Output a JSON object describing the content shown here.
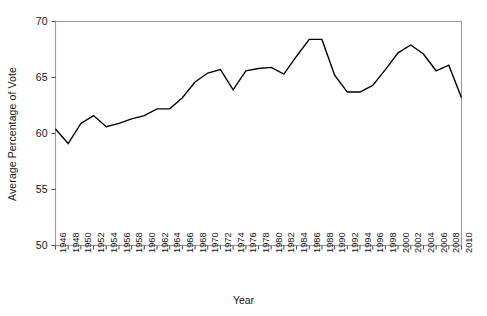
{
  "chart_data": {
    "type": "line",
    "title": "",
    "xlabel": "Year",
    "ylabel": "Average Percentage of Vote",
    "xlim": [
      1946,
      2010
    ],
    "ylim": [
      50,
      70
    ],
    "yticks": [
      50,
      55,
      60,
      65,
      70
    ],
    "grid": false,
    "legend": null,
    "line_color": "#000000",
    "frame_color": "#9a9a9a",
    "x": [
      1946,
      1948,
      1950,
      1952,
      1954,
      1956,
      1958,
      1960,
      1962,
      1964,
      1966,
      1968,
      1970,
      1972,
      1974,
      1976,
      1978,
      1980,
      1982,
      1984,
      1986,
      1988,
      1990,
      1992,
      1994,
      1996,
      1998,
      2000,
      2002,
      2004,
      2006,
      2008,
      2010
    ],
    "xticks": [
      "1946",
      "1948",
      "1950",
      "1952",
      "1954",
      "1956",
      "1958",
      "1960",
      "1962",
      "1964",
      "1966",
      "1968",
      "1970",
      "1972",
      "1974",
      "1976",
      "1978",
      "1980",
      "1982",
      "1984",
      "1986",
      "1988",
      "1990",
      "1992",
      "1994",
      "1996",
      "1998",
      "2000",
      "2002",
      "2004",
      "2006",
      "2008",
      "2010"
    ],
    "series": [
      {
        "name": "Average Percentage of Vote",
        "values": [
          60.4,
          59.1,
          60.9,
          61.6,
          60.6,
          60.9,
          61.3,
          61.6,
          62.2,
          62.2,
          63.2,
          64.6,
          65.4,
          65.7,
          63.9,
          65.6,
          65.8,
          65.9,
          65.3,
          66.9,
          68.4,
          68.4,
          65.2,
          63.7,
          63.7,
          64.3,
          65.7,
          67.2,
          67.9,
          67.1,
          65.6,
          66.1,
          63.2
        ]
      }
    ]
  }
}
